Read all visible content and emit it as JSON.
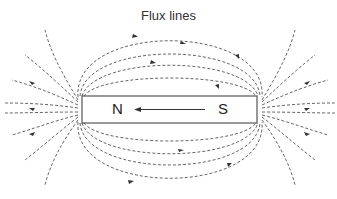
{
  "diagram": {
    "title": "Flux lines",
    "magnet": {
      "north_label": "N",
      "south_label": "S",
      "arrow_direction": "S-to-N (internal)"
    },
    "colors": {
      "line": "#555555",
      "magnet_border": "#555555",
      "text": "#222222"
    },
    "field_direction": "external lines run from N around to S"
  }
}
